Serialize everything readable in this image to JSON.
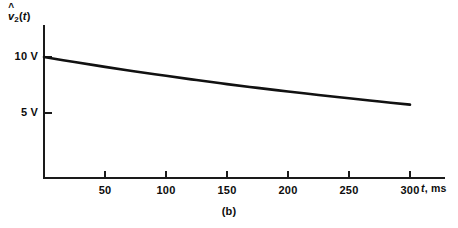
{
  "figure": {
    "caption": "(b)",
    "background_color": "#ffffff",
    "ink_color": "#111111"
  },
  "chart_data": {
    "type": "line",
    "title": "",
    "subtitle": "",
    "caption": "(b)",
    "xlabel": "t, ms",
    "xlabel_symbol": "t",
    "xlabel_unit": ", ms",
    "ylabel": "v̂2(t)",
    "ylabel_parts": {
      "symbol": "v",
      "accent": "ˆ",
      "subscript": "2",
      "argument": "(t)"
    },
    "xlim": [
      0,
      330
    ],
    "ylim": [
      0,
      11.8
    ],
    "xticks": [
      50,
      100,
      150,
      200,
      250,
      300
    ],
    "xtick_labels": [
      "50",
      "100",
      "150",
      "200",
      "250",
      "300"
    ],
    "yticks": [
      5,
      10
    ],
    "ytick_labels": [
      "5 V",
      "10 V"
    ],
    "grid": false,
    "legend": false,
    "legend_position": "none",
    "series": [
      {
        "name": "v̂2(t)",
        "color": "#111111",
        "x": [
          0,
          25,
          50,
          75,
          100,
          125,
          150,
          175,
          200,
          225,
          250,
          275,
          300
        ],
        "y": [
          10.0,
          9.55,
          9.12,
          8.71,
          8.32,
          7.94,
          7.58,
          7.24,
          6.92,
          6.61,
          6.31,
          6.02,
          5.75
        ]
      }
    ],
    "annotations": []
  },
  "axes": {
    "y_axis_name": "voltage-axis",
    "x_axis_name": "time-axis"
  }
}
